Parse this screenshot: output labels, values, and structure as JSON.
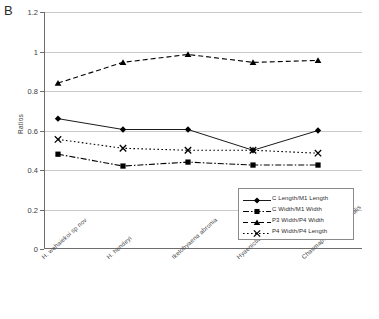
{
  "panel": {
    "letter": "B"
  },
  "chart_data": {
    "type": "line",
    "title": "",
    "xlabel": "",
    "ylabel": "Ratios",
    "ylim": [
      0,
      1.2
    ],
    "ytick_values": [
      "1.2",
      "1",
      "0.8",
      "0.6",
      "0.4",
      "0.2",
      "0"
    ],
    "grid": true,
    "legend_position": "inside-bottom-right",
    "categories": [
      "H. wehaiekoi sp nov",
      "H. hendeyi",
      "Ikelohyaena abronia",
      "Hyaenictitherium namaquensis",
      "Chasmaporthetes australis"
    ],
    "series": [
      {
        "name": "C Length/M1 Length",
        "marker": "diamond",
        "line_style": "solid",
        "color": "#000000",
        "values": [
          0.66,
          0.605,
          0.605,
          0.5,
          0.6
        ]
      },
      {
        "name": "C Width/M1 Width",
        "marker": "square",
        "line_style": "dash-dot",
        "color": "#000000",
        "values": [
          0.48,
          0.42,
          0.44,
          0.425,
          0.425
        ]
      },
      {
        "name": "P3 Width/P4 Width",
        "marker": "triangle",
        "line_style": "dashed",
        "color": "#000000",
        "values": [
          0.84,
          0.945,
          0.985,
          0.945,
          0.955
        ]
      },
      {
        "name": "P4 Width/P4 Length",
        "marker": "x",
        "line_style": "dotted",
        "color": "#000000",
        "values": [
          0.555,
          0.51,
          0.5,
          0.5,
          0.485
        ]
      }
    ]
  },
  "legend": {
    "items": [
      "C Length/M1 Length",
      "C Width/M1 Width",
      "P3 Width/P4 Width",
      "P4 Width/P4 Length"
    ]
  }
}
